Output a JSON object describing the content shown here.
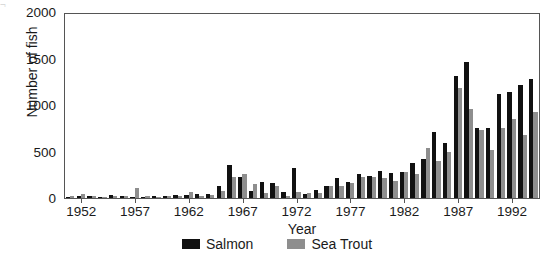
{
  "artifact": {
    "top_strip_text": "¬                                                                                                      "
  },
  "chart_data": {
    "type": "bar",
    "title": "",
    "xlabel": "Year",
    "ylabel": "Number of fish",
    "ylim": [
      0,
      2000
    ],
    "yticks": [
      0,
      500,
      1000,
      1500,
      2000
    ],
    "xticks": [
      1952,
      1957,
      1962,
      1967,
      1972,
      1977,
      1982,
      1987,
      1992
    ],
    "grid": false,
    "legend_position": "bottom-center",
    "colors": {
      "salmon": "#111111",
      "sea_trout": "#8e8e8e"
    },
    "categories": [
      1951,
      1952,
      1953,
      1954,
      1955,
      1956,
      1957,
      1958,
      1959,
      1960,
      1961,
      1962,
      1963,
      1964,
      1965,
      1966,
      1967,
      1968,
      1969,
      1970,
      1971,
      1972,
      1973,
      1974,
      1975,
      1976,
      1977,
      1978,
      1979,
      1980,
      1981,
      1982,
      1983,
      1984,
      1985,
      1986,
      1987,
      1988,
      1989,
      1990,
      1991,
      1992,
      1993,
      1994
    ],
    "series": [
      {
        "name": "Salmon",
        "color": "#111111",
        "values": [
          10,
          25,
          20,
          15,
          30,
          20,
          15,
          10,
          25,
          20,
          35,
          30,
          45,
          40,
          130,
          360,
          230,
          80,
          175,
          165,
          60,
          330,
          45,
          90,
          130,
          215,
          175,
          260,
          240,
          290,
          270,
          280,
          380,
          420,
          720,
          600,
          1330,
          1480,
          760,
          760,
          1130,
          1150,
          1230,
          1290
        ]
      },
      {
        "name": "Sea Trout",
        "color": "#8e8e8e",
        "values": [
          20,
          40,
          20,
          15,
          20,
          25,
          110,
          20,
          15,
          20,
          20,
          60,
          20,
          30,
          75,
          230,
          260,
          150,
          50,
          135,
          25,
          60,
          55,
          55,
          130,
          130,
          160,
          230,
          230,
          215,
          190,
          280,
          260,
          540,
          400,
          500,
          1200,
          970,
          740,
          520,
          760,
          860,
          690,
          930
        ]
      }
    ]
  },
  "legend": {
    "items": [
      {
        "label": "Salmon",
        "color": "#111111"
      },
      {
        "label": "Sea Trout",
        "color": "#8e8e8e"
      }
    ]
  }
}
